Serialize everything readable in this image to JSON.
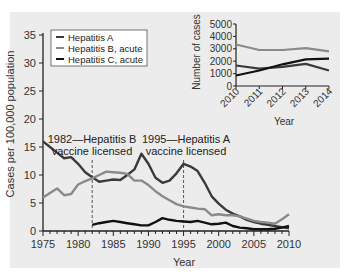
{
  "chart_data": [
    {
      "type": "line",
      "title": "",
      "xlabel": "Year",
      "ylabel": "Cases per 100,000 population",
      "xlim": [
        1975,
        2010
      ],
      "ylim": [
        0,
        35
      ],
      "x_ticks": [
        1975,
        1980,
        1985,
        1990,
        1995,
        2000,
        2005,
        2010
      ],
      "y_ticks": [
        0,
        5,
        10,
        15,
        20,
        25,
        30,
        35
      ],
      "grid": false,
      "legend_position": "upper left",
      "legend": [
        "Hepatitis A",
        "Hepatitis B, acute",
        "Hepatitis C, acute"
      ],
      "series": [
        {
          "name": "Hepatitis A",
          "color": "#3a3a3a",
          "x": [
            1975,
            1976,
            1977,
            1978,
            1979,
            1980,
            1981,
            1982,
            1983,
            1984,
            1985,
            1986,
            1987,
            1988,
            1989,
            1990,
            1991,
            1992,
            1993,
            1994,
            1995,
            1996,
            1997,
            1998,
            1999,
            2000,
            2001,
            2002,
            2003,
            2004,
            2005,
            2006,
            2007,
            2008,
            2009,
            2010
          ],
          "values": [
            16.0,
            15.0,
            14.0,
            13.0,
            13.2,
            12.0,
            10.5,
            9.6,
            8.8,
            9.0,
            9.2,
            9.1,
            10.0,
            11.0,
            13.8,
            12.0,
            9.5,
            8.6,
            9.0,
            10.3,
            12.0,
            11.5,
            10.7,
            8.6,
            6.2,
            4.9,
            3.8,
            3.1,
            2.6,
            2.0,
            1.6,
            1.3,
            1.1,
            0.9,
            0.7,
            0.5
          ]
        },
        {
          "name": "Hepatitis B, acute",
          "color": "#8a8a8a",
          "x": [
            1975,
            1976,
            1977,
            1978,
            1979,
            1980,
            1981,
            1982,
            1983,
            1984,
            1985,
            1986,
            1987,
            1988,
            1989,
            1990,
            1991,
            1992,
            1993,
            1994,
            1995,
            1996,
            1997,
            1998,
            1999,
            2000,
            2001,
            2002,
            2003,
            2004,
            2005,
            2006,
            2007,
            2008,
            2009,
            2010
          ],
          "values": [
            6.0,
            6.8,
            7.6,
            6.4,
            6.6,
            8.3,
            8.9,
            9.4,
            10.0,
            10.6,
            10.5,
            10.4,
            10.2,
            9.0,
            9.0,
            8.2,
            7.1,
            6.2,
            5.5,
            4.8,
            4.4,
            4.2,
            4.0,
            3.9,
            2.8,
            3.0,
            2.8,
            2.8,
            2.6,
            2.2,
            1.8,
            1.6,
            1.5,
            1.3,
            2.1,
            3.0
          ]
        },
        {
          "name": "Hepatitis C, acute",
          "color": "#111111",
          "x": [
            1982,
            1983,
            1984,
            1985,
            1986,
            1987,
            1988,
            1989,
            1990,
            1991,
            1992,
            1993,
            1994,
            1995,
            1996,
            1997,
            1998,
            1999,
            2000,
            2001,
            2002,
            2003,
            2004,
            2005,
            2006,
            2007,
            2008,
            2009,
            2010
          ],
          "values": [
            1.1,
            1.4,
            1.6,
            1.8,
            1.6,
            1.4,
            1.2,
            1.0,
            1.0,
            1.6,
            2.3,
            2.0,
            1.8,
            1.7,
            1.6,
            1.8,
            1.5,
            1.2,
            1.3,
            1.5,
            0.9,
            0.6,
            0.5,
            0.3,
            0.3,
            0.3,
            0.4,
            0.6,
            0.9
          ]
        }
      ],
      "annotations": [
        {
          "x": 1982,
          "lines": [
            "1982—Hepatitis B",
            "vaccine licensed"
          ]
        },
        {
          "x": 1995,
          "lines": [
            "1995—Hepatitis A",
            "vaccine licensed"
          ]
        }
      ]
    },
    {
      "type": "line",
      "title": "",
      "xlabel": "Year",
      "ylabel": "Number of cases",
      "xlim": [
        2010,
        2014
      ],
      "ylim": [
        0,
        5000
      ],
      "x_ticks": [
        2010,
        2011,
        2012,
        2013,
        2014
      ],
      "y_ticks": [
        0,
        1000,
        2000,
        3000,
        4000,
        5000
      ],
      "grid": false,
      "position": "inset upper right",
      "x": [
        2010,
        2011,
        2012,
        2013,
        2014
      ],
      "series": [
        {
          "name": "Hepatitis A",
          "color": "#3a3a3a",
          "values": [
            1650,
            1400,
            1550,
            1780,
            1250
          ]
        },
        {
          "name": "Hepatitis B, acute",
          "color": "#8a8a8a",
          "values": [
            3350,
            2900,
            2900,
            3050,
            2800
          ]
        },
        {
          "name": "Hepatitis C, acute",
          "color": "#111111",
          "values": [
            850,
            1250,
            1750,
            2150,
            2200
          ]
        }
      ]
    }
  ],
  "main": {
    "ylabel": "Cases per 100,000 population",
    "xlabel": "Year",
    "annotation_1982_line1": "1982—Hepatitis B",
    "annotation_1982_line2": "vaccine licensed",
    "annotation_1995_line1": "1995—Hepatitis A",
    "annotation_1995_line2": "vaccine licensed"
  },
  "legend": {
    "items": [
      "Hepatitis A",
      "Hepatitis B, acute",
      "Hepatitis C, acute"
    ]
  },
  "inset": {
    "ylabel": "Number of cases",
    "xlabel": "Year"
  },
  "colors": {
    "panel_bg": "#ececec",
    "hep_a": "#3a3a3a",
    "hep_b": "#8a8a8a",
    "hep_c": "#111111"
  }
}
